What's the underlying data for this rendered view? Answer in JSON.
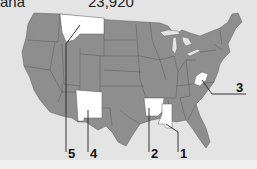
{
  "header": {
    "state_name_partial": "ana",
    "value_partial": "23,920"
  },
  "map": {
    "title": "United States map",
    "colors": {
      "background": "#e4e4e4",
      "state_fill": "#8e8e8e",
      "highlight_fill": "#ffffff",
      "border": "#5a5a5a"
    },
    "highlighted_states": [
      {
        "id": "mississippi",
        "label": "1"
      },
      {
        "id": "arkansas",
        "label": "2"
      },
      {
        "id": "west-virginia",
        "label": "3"
      },
      {
        "id": "new-mexico",
        "label": "4"
      },
      {
        "id": "montana",
        "label": "5"
      }
    ]
  },
  "labels": {
    "l1": "1",
    "l2": "2",
    "l3": "3",
    "l4": "4",
    "l5": "5"
  }
}
